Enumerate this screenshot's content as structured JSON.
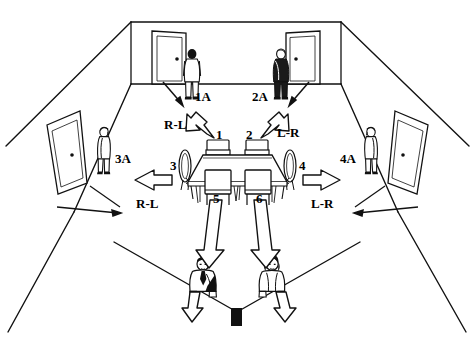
{
  "diagram": {
    "type": "room-layout",
    "colors": {
      "ink": "#000000",
      "paper": "#ffffff",
      "fill_light": "#f2f2f2",
      "fill_dark": "#1a1a1a"
    },
    "room": {
      "walls": [
        "back-wall",
        "left-wall",
        "right-wall"
      ],
      "doors": [
        {
          "name": "back-left-door",
          "wall": "back-wall"
        },
        {
          "name": "back-right-door",
          "wall": "back-wall"
        },
        {
          "name": "left-side-door",
          "wall": "left-wall"
        },
        {
          "name": "right-side-door",
          "wall": "right-wall"
        }
      ]
    },
    "table": {
      "name": "conference-table",
      "seat_count": 6
    },
    "seats": [
      {
        "id": "1",
        "label": "1",
        "position": "back-left"
      },
      {
        "id": "2",
        "label": "2",
        "position": "back-right"
      },
      {
        "id": "3",
        "label": "3",
        "position": "left-end"
      },
      {
        "id": "4",
        "label": "4",
        "position": "right-end"
      },
      {
        "id": "5",
        "label": "5",
        "position": "front-left"
      },
      {
        "id": "6",
        "label": "6",
        "position": "front-right"
      }
    ],
    "destinations": [
      {
        "id": "1A",
        "label": "1A",
        "from_seat": "1",
        "location": "back-wall-left"
      },
      {
        "id": "2A",
        "label": "2A",
        "from_seat": "2",
        "location": "back-wall-right"
      },
      {
        "id": "3A",
        "label": "3A",
        "from_seat": "3",
        "location": "left-wall"
      },
      {
        "id": "4A",
        "label": "4A",
        "from_seat": "4",
        "location": "right-wall"
      }
    ],
    "direction_labels": [
      {
        "id": "dir-top-left",
        "label": "R-L",
        "near_seat": "1"
      },
      {
        "id": "dir-top-right",
        "label": "L-R",
        "near_seat": "2"
      },
      {
        "id": "dir-mid-left",
        "label": "R-L",
        "near_seat": "3"
      },
      {
        "id": "dir-mid-right",
        "label": "L-R",
        "near_seat": "4"
      }
    ],
    "people": [
      {
        "id": "person-1a",
        "at": "1A",
        "facing": "away"
      },
      {
        "id": "person-2a",
        "at": "2A",
        "facing": "away"
      },
      {
        "id": "person-3a",
        "at": "3A",
        "facing": "left"
      },
      {
        "id": "person-4a",
        "at": "4A",
        "facing": "right"
      },
      {
        "id": "person-front-left",
        "at": "front-left-exit",
        "facing": "viewer"
      },
      {
        "id": "person-front-right",
        "at": "front-right-exit",
        "facing": "viewer"
      }
    ],
    "arrows": [
      {
        "id": "arrow-seat1-to-1A",
        "from": "1",
        "to": "1A",
        "style": "outline"
      },
      {
        "id": "arrow-seat2-to-2A",
        "from": "2",
        "to": "2A",
        "style": "outline"
      },
      {
        "id": "arrow-seat3-to-3A",
        "from": "3",
        "to": "3A",
        "style": "outline"
      },
      {
        "id": "arrow-seat4-to-4A",
        "from": "4",
        "to": "4A",
        "style": "outline"
      },
      {
        "id": "arrow-seat5-exit",
        "from": "5",
        "to": "front-left-exit",
        "style": "outline"
      },
      {
        "id": "arrow-seat6-exit",
        "from": "6",
        "to": "front-right-exit",
        "style": "outline"
      },
      {
        "id": "arrow-1A-door",
        "from": "1A",
        "to": "back-left-door",
        "style": "thin"
      },
      {
        "id": "arrow-2A-door",
        "from": "2A",
        "to": "back-right-door",
        "style": "thin"
      },
      {
        "id": "arrow-3A-door",
        "from": "3A",
        "to": "left-side-door",
        "style": "thin"
      },
      {
        "id": "arrow-4A-door",
        "from": "4A",
        "to": "right-side-door",
        "style": "thin"
      },
      {
        "id": "arrow-front-left-out",
        "from": "front-left-exit",
        "to": "viewer",
        "style": "outline"
      },
      {
        "id": "arrow-front-right-out",
        "from": "front-right-exit",
        "to": "viewer",
        "style": "outline"
      }
    ]
  }
}
